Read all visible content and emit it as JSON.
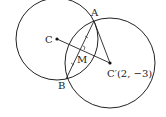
{
  "diagram": {
    "title": "",
    "points": {
      "A": {
        "label": "A",
        "x": 94,
        "y": 21
      },
      "B": {
        "label": "B",
        "x": 66,
        "y": 79
      },
      "C": {
        "label": "C",
        "x": 57,
        "y": 39
      },
      "C_prime": {
        "label": "C′(2, −3)",
        "x": 110,
        "y": 63
      },
      "M": {
        "label": "M",
        "x": 80,
        "y": 50
      }
    },
    "circles": [
      {
        "name": "circle-C",
        "cx": 57,
        "cy": 39,
        "r": 41
      },
      {
        "name": "circle-C-prime",
        "cx": 110,
        "cy": 63,
        "r": 45
      }
    ],
    "colors": {
      "stroke": "#222222",
      "background": "#ffffff"
    }
  }
}
